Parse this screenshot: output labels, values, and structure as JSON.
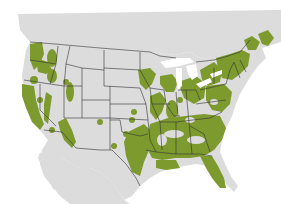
{
  "map": {
    "title": "Species range map — contiguous United States",
    "region": "North America (USA, southern Canada, northern Mexico)",
    "colors": {
      "land": "#dcdcdc",
      "water": "#ffffff",
      "range": "#7d9a2e",
      "border": "#333333",
      "great_lakes": "#ffffff"
    },
    "legend": {
      "range_label": "Range"
    },
    "range_regions": [
      "Pacific Northwest coast",
      "Northern Rockies / Idaho",
      "California coast and Sierra Nevada",
      "Arizona highlands",
      "Colorado / New Mexico spots",
      "Texas / Oklahoma",
      "Mississippi valley and Midwest",
      "Great Lakes region",
      "Northeast / New England",
      "Southeast including Florida",
      "Maritime Canada"
    ]
  }
}
